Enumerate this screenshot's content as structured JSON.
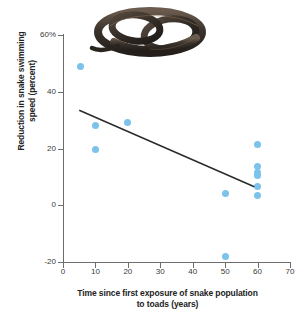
{
  "chart_data": {
    "type": "scatter",
    "title": "",
    "xlabel": "Time since first exposure of snake population to toads (years)",
    "xlabel_line1": "Time since first exposure of snake population",
    "xlabel_line2": "to toads (years)",
    "ylabel": "Reduction in snake swimming speed (percent)",
    "ylabel_line1": "Reduction in snake swimming",
    "ylabel_line2": "speed (percent)",
    "xlim": [
      0,
      70
    ],
    "ylim": [
      -20,
      60
    ],
    "xticks": [
      0,
      10,
      20,
      30,
      40,
      50,
      60,
      70
    ],
    "xtick_labels": [
      "0",
      "10",
      "20",
      "30",
      "40",
      "50",
      "60",
      "70"
    ],
    "yticks": [
      -20,
      0,
      20,
      40,
      60
    ],
    "ytick_labels": [
      "-20",
      "0",
      "20",
      "40",
      "60%"
    ],
    "grid": false,
    "legend": false,
    "point_color": "#7cc3ec",
    "line_color": "#2b2b2b",
    "points": [
      {
        "x": 5.5,
        "y": 49.0
      },
      {
        "x": 10.0,
        "y": 28.0
      },
      {
        "x": 10.0,
        "y": 19.5
      },
      {
        "x": 20.0,
        "y": 29.0
      },
      {
        "x": 50.0,
        "y": 4.0
      },
      {
        "x": 50.0,
        "y": -18.0
      },
      {
        "x": 60.0,
        "y": 21.5
      },
      {
        "x": 60.0,
        "y": 13.5
      },
      {
        "x": 60.0,
        "y": 11.5
      },
      {
        "x": 60.0,
        "y": 10.5
      },
      {
        "x": 60.0,
        "y": 6.5
      },
      {
        "x": 60.0,
        "y": 3.5
      }
    ],
    "trendline": {
      "x0": 5.0,
      "y0": 33.5,
      "x1": 59.0,
      "y1": 6.5
    }
  },
  "photo": {
    "caption": "coiled dark keelback snake",
    "alt_name": "snake-photo"
  }
}
